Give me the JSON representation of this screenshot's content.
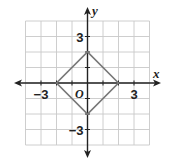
{
  "chart_data": {
    "type": "line",
    "title": "",
    "xlabel": "x",
    "ylabel": "y",
    "origin_label": "O",
    "xlim": [
      -4,
      4
    ],
    "ylim": [
      -4,
      4
    ],
    "grid": true,
    "grid_step": 1,
    "x_tick_labels": [
      {
        "value": -3,
        "label": "−3"
      },
      {
        "value": 3,
        "label": "3"
      }
    ],
    "y_tick_labels": [
      {
        "value": 3,
        "label": "3"
      },
      {
        "value": -3,
        "label": "−3"
      }
    ],
    "series": [
      {
        "name": "square",
        "closed": true,
        "points": [
          [
            2,
            0
          ],
          [
            0,
            2
          ],
          [
            -2,
            0
          ],
          [
            0,
            -2
          ]
        ],
        "color": "#777777"
      }
    ]
  },
  "colors": {
    "grid": "#c8c8c8",
    "axis": "#222222",
    "shape": "#777777"
  }
}
